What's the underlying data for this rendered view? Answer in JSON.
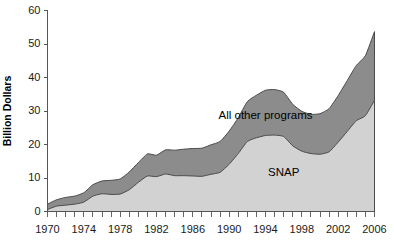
{
  "chart_data": {
    "type": "area",
    "title": "",
    "xlabel": "",
    "ylabel": "Billion Dollars",
    "ylim": [
      0,
      60
    ],
    "xlim": [
      1970,
      2006
    ],
    "grid": false,
    "legend_position": "inline-annotation",
    "stacked": true,
    "y_ticks": [
      0,
      10,
      20,
      30,
      40,
      50,
      60
    ],
    "y_tick_labels": [
      "0",
      "10",
      "20",
      "30",
      "40",
      "50",
      "60"
    ],
    "x_tick_labels": [
      "1970",
      "1974",
      "1978",
      "1982",
      "1986",
      "1990",
      "1994",
      "1998",
      "2002",
      "2006"
    ],
    "x_tick_label_years": [
      1970,
      1974,
      1978,
      1982,
      1986,
      1990,
      1994,
      1998,
      2002,
      2006
    ],
    "x_minor_tick_years": [
      1970,
      1971,
      1972,
      1973,
      1974,
      1975,
      1976,
      1977,
      1978,
      1979,
      1980,
      1981,
      1982,
      1983,
      1984,
      1985,
      1986,
      1987,
      1988,
      1989,
      1990,
      1991,
      1992,
      1993,
      1994,
      1995,
      1996,
      1997,
      1998,
      1999,
      2000,
      2001,
      2002,
      2003,
      2004,
      2005,
      2006
    ],
    "x": [
      1970,
      1971,
      1972,
      1973,
      1974,
      1975,
      1976,
      1977,
      1978,
      1979,
      1980,
      1981,
      1982,
      1983,
      1984,
      1985,
      1986,
      1987,
      1988,
      1989,
      1990,
      1991,
      1992,
      1993,
      1994,
      1995,
      1996,
      1997,
      1998,
      1999,
      2000,
      2001,
      2002,
      2003,
      2004,
      2005,
      2006
    ],
    "series": [
      {
        "name": "SNAP",
        "color": "#d2d2d2",
        "label": "SNAP",
        "values": [
          0.6,
          1.6,
          1.9,
          2.2,
          2.8,
          4.6,
          5.3,
          5.1,
          5.2,
          6.5,
          8.7,
          10.6,
          10.4,
          11.2,
          10.7,
          10.7,
          10.6,
          10.5,
          11.1,
          11.7,
          14.1,
          17.3,
          20.9,
          22.0,
          22.7,
          22.8,
          22.4,
          19.6,
          18.0,
          17.3,
          17.1,
          17.8,
          20.7,
          23.9,
          27.1,
          28.6,
          33.2
        ]
      },
      {
        "name": "All other programs",
        "color": "#8c8c8c",
        "label": "All other programs",
        "values": [
          1.6,
          1.9,
          2.3,
          2.4,
          2.8,
          3.4,
          3.8,
          4.2,
          4.5,
          5.3,
          5.9,
          6.6,
          6.4,
          7.2,
          7.6,
          7.9,
          8.2,
          8.4,
          8.8,
          9.2,
          9.9,
          10.7,
          11.9,
          12.7,
          13.5,
          13.6,
          13.2,
          12.4,
          11.9,
          11.7,
          12.1,
          12.9,
          13.9,
          15.2,
          16.5,
          17.9,
          20.5
        ]
      }
    ],
    "series_annotations": [
      {
        "text": "All other programs",
        "x": 1994,
        "y": 27.5
      },
      {
        "text": "SNAP",
        "x": 1996,
        "y": 10.5
      }
    ]
  }
}
